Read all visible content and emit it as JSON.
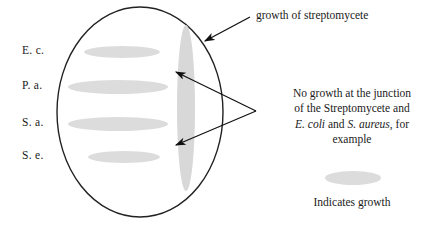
{
  "figure": {
    "type": "cross-streak-antibiosis-assay-diagram",
    "row_labels": [
      {
        "id": "e-c",
        "text": "E. c."
      },
      {
        "id": "p-a",
        "text": "P. a."
      },
      {
        "id": "s-a",
        "text": "S. a."
      },
      {
        "id": "s-e",
        "text": "S. e."
      }
    ],
    "annotations": {
      "streptomycete_callout": "growth of streptomycete",
      "no_growth_note": {
        "line1": "No growth at the junction",
        "line2": "of the Streptomycete and",
        "line3_part1": "E. coli",
        "line3_part2": " and ",
        "line3_part3": "S. aureus",
        "line3_part4": ", for",
        "line4": "example"
      },
      "legend_caption": "Indicates growth"
    },
    "colors": {
      "growth_fill": "#dcdcdc",
      "streptomycete_fill": "#d8d8d8",
      "outline": "#222222",
      "arrow": "#111111",
      "background": "#ffffff",
      "text": "#1a1a1a"
    },
    "dish": {
      "center_x": 140,
      "center_y": 112,
      "radius_x": 83,
      "radius_y": 105
    },
    "streaks": [
      {
        "id": "e-c",
        "cx": 122,
        "cy": 52,
        "rx": 38,
        "ry": 6
      },
      {
        "id": "p-a",
        "cx": 118,
        "cy": 87,
        "rx": 50,
        "ry": 7
      },
      {
        "id": "s-a",
        "cx": 118,
        "cy": 124,
        "rx": 50,
        "ry": 7
      },
      {
        "id": "s-e",
        "cx": 124,
        "cy": 157,
        "rx": 36,
        "ry": 6
      }
    ],
    "streptomycete_streak": {
      "cx": 186,
      "cy": 108,
      "rx": 9,
      "ry": 83
    },
    "legend_swatch": {
      "cx": 353,
      "cy": 178,
      "rx": 28,
      "ry": 7
    }
  }
}
